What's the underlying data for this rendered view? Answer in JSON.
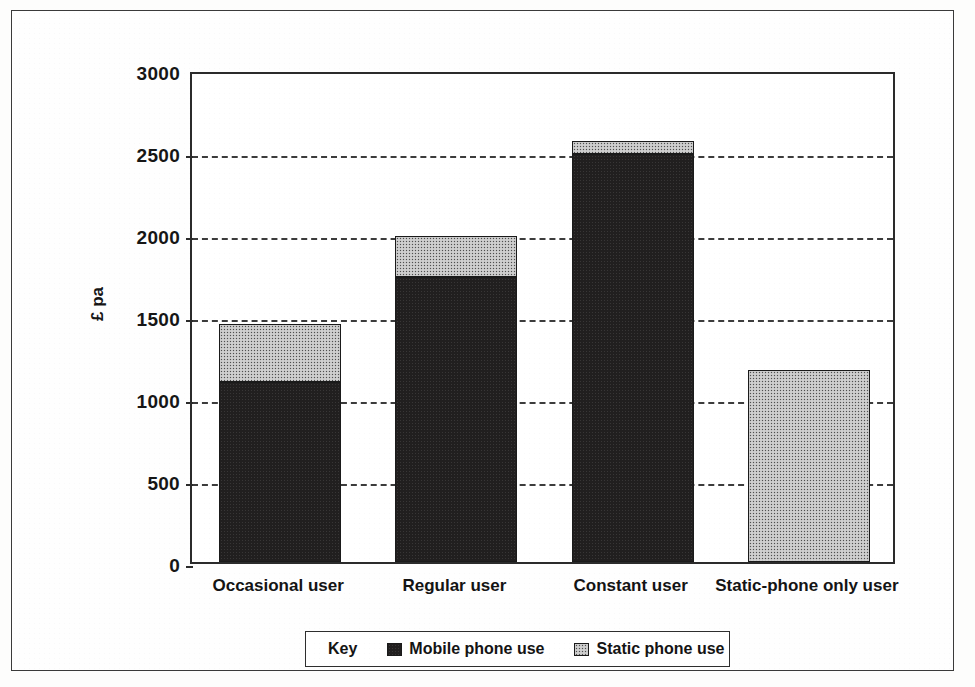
{
  "figure": {
    "legend": {
      "title": "Key",
      "entries": [
        {
          "label": "Mobile phone use",
          "swatch": "dark-swatch-icon",
          "color": "#211f1f"
        },
        {
          "label": "Static phone use",
          "swatch": "light-swatch-icon",
          "color": "#c3c3c3"
        }
      ]
    }
  },
  "chart_data": {
    "type": "bar",
    "title": "",
    "subtitle": "",
    "xlabel": "",
    "ylabel": "£ pa",
    "ylim": [
      0,
      3000
    ],
    "ytick_labels": [
      "0",
      "500",
      "1000",
      "1500",
      "2000",
      "2500",
      "3000"
    ],
    "yticks": [
      0,
      500,
      1000,
      1500,
      2000,
      2500,
      3000
    ],
    "grid": "horizontal-dashed",
    "stacked": true,
    "legend_position": "bottom",
    "categories": [
      "Occasional user",
      "Regular user",
      "Constant user",
      "Static-phone only user"
    ],
    "series": [
      {
        "name": "Mobile phone use",
        "color": "#211f1f",
        "values": [
          1100,
          1740,
          2490,
          0
        ]
      },
      {
        "name": "Static phone use",
        "color": "#c3c3c3",
        "values": [
          350,
          250,
          80,
          1170
        ]
      }
    ],
    "totals": [
      1450,
      1990,
      2570,
      1170
    ]
  }
}
